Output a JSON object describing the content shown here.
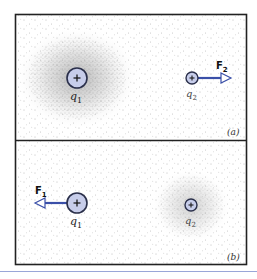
{
  "figure": {
    "colors": {
      "frame": "#222222",
      "charge_fill": "#c7cdea",
      "charge_stroke": "#2a2f4a",
      "arrow": "#3a4fa8",
      "dots": "#555555",
      "underline": "#9aa6d8"
    },
    "panels": [
      {
        "id": "a",
        "label": "(a)",
        "dense_field_around": "q1",
        "charges": [
          {
            "name": "q1",
            "label": "q",
            "subscript": "1",
            "sign": "+",
            "size": "large"
          },
          {
            "name": "q2",
            "label": "q",
            "subscript": "2",
            "sign": "+",
            "size": "small"
          }
        ],
        "force": {
          "label": "F",
          "subscript": "2",
          "on": "q2",
          "direction": "right"
        }
      },
      {
        "id": "b",
        "label": "(b)",
        "dense_field_around": "q2",
        "charges": [
          {
            "name": "q1",
            "label": "q",
            "subscript": "1",
            "sign": "+",
            "size": "large"
          },
          {
            "name": "q2",
            "label": "q",
            "subscript": "2",
            "sign": "+",
            "size": "small"
          }
        ],
        "force": {
          "label": "F",
          "subscript": "1",
          "on": "q1",
          "direction": "left"
        }
      }
    ]
  }
}
